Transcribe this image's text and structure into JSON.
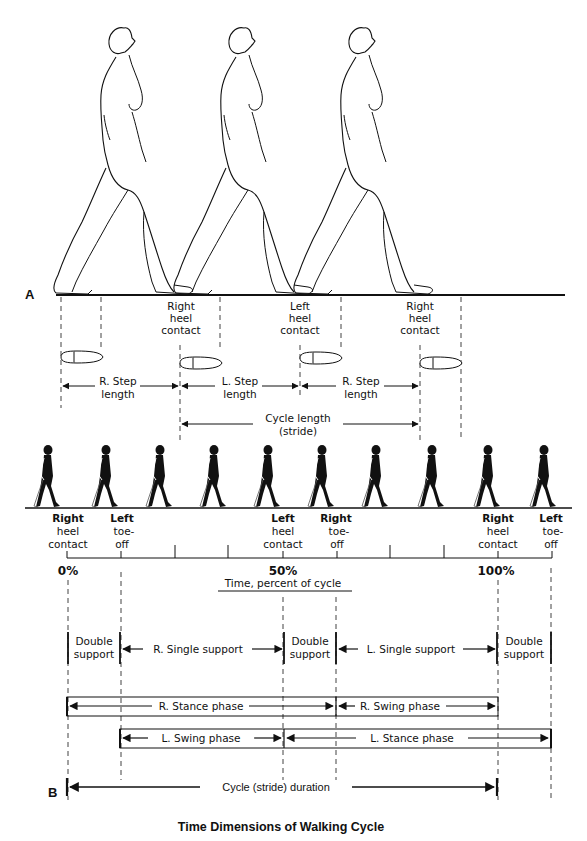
{
  "figure": {
    "caption": "Time Dimensions of Walking Cycle",
    "panel_a_label": "A",
    "panel_b_label": "B"
  },
  "panel_a": {
    "figures_count": 3,
    "event_labels": [
      {
        "line1": "Right",
        "line2": "heel",
        "line3": "contact"
      },
      {
        "line1": "Left",
        "line2": "heel",
        "line3": "contact"
      },
      {
        "line1": "Right",
        "line2": "heel",
        "line3": "contact"
      }
    ],
    "step_lengths": [
      {
        "line1": "R. Step",
        "line2": "length"
      },
      {
        "line1": "L. Step",
        "line2": "length"
      },
      {
        "line1": "R. Step",
        "line2": "length"
      }
    ],
    "cycle_length": {
      "line1": "Cycle length",
      "line2": "(stride)"
    }
  },
  "panel_b": {
    "silhouettes_count": 10,
    "events": [
      {
        "line1": "Right",
        "line2": "heel",
        "line3": "contact"
      },
      {
        "line1": "Left",
        "line2": "toe-",
        "line3": "off"
      },
      {
        "line1": "Left",
        "line2": "heel",
        "line3": "contact"
      },
      {
        "line1": "Right",
        "line2": "toe-",
        "line3": "off"
      },
      {
        "line1": "Right",
        "line2": "heel",
        "line3": "contact"
      },
      {
        "line1": "Left",
        "line2": "toe-",
        "line3": "off"
      }
    ],
    "percent_labels": [
      "0%",
      "50%",
      "100%"
    ],
    "time_axis_label": "Time, percent of cycle",
    "support_phases": [
      {
        "line1": "Double",
        "line2": "support"
      },
      {
        "line1": "R. Single support"
      },
      {
        "line1": "Double",
        "line2": "support"
      },
      {
        "line1": "L. Single support"
      },
      {
        "line1": "Double",
        "line2": "support"
      }
    ],
    "right_leg_phases": [
      "R. Stance phase",
      "R. Swing phase"
    ],
    "left_leg_phases": [
      "L. Swing phase",
      "L. Stance phase"
    ],
    "cycle_duration": "Cycle (stride) duration"
  }
}
